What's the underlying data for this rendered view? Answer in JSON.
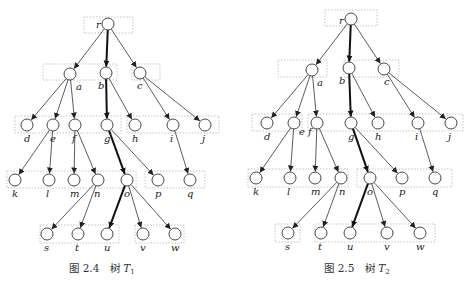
{
  "trees": [
    {
      "id": "T1",
      "caption": {
        "fig": "图 2.4",
        "word": "树",
        "symbol": "T",
        "sub": "1",
        "x": 102,
        "y": 272
      },
      "nodes": {
        "r": [
          108,
          24
        ],
        "a": [
          70,
          74
        ],
        "b": [
          106,
          73
        ],
        "c": [
          140,
          73
        ],
        "d": [
          27,
          125
        ],
        "e": [
          53,
          125
        ],
        "f": [
          75,
          125
        ],
        "g": [
          107,
          125
        ],
        "h": [
          135,
          125
        ],
        "i": [
          173,
          125
        ],
        "j": [
          205,
          125
        ],
        "k": [
          15,
          180
        ],
        "l": [
          49,
          180
        ],
        "m": [
          74,
          180
        ],
        "n": [
          98,
          180
        ],
        "o": [
          127,
          180
        ],
        "p": [
          158,
          180
        ],
        "q": [
          190,
          180
        ],
        "s": [
          47,
          234
        ],
        "t": [
          78,
          234
        ],
        "u": [
          107,
          234
        ],
        "v": [
          143,
          234
        ],
        "w": [
          175,
          234
        ]
      },
      "label_pos": {
        "r": [
          -12,
          4
        ],
        "a": [
          6,
          16
        ],
        "b": [
          -8,
          16
        ],
        "c": [
          -3,
          16
        ],
        "d": [
          -3,
          17
        ],
        "e": [
          -3,
          17
        ],
        "f": [
          -3,
          17
        ],
        "g": [
          -3,
          17
        ],
        "h": [
          -3,
          17
        ],
        "i": [
          -3,
          17
        ],
        "j": [
          -3,
          17
        ],
        "k": [
          -3,
          17
        ],
        "l": [
          -3,
          17
        ],
        "m": [
          -4,
          17
        ],
        "n": [
          -4,
          17
        ],
        "o": [
          -3,
          17
        ],
        "p": [
          -3,
          17
        ],
        "q": [
          -3,
          17
        ],
        "s": [
          -3,
          17
        ],
        "t": [
          -3,
          17
        ],
        "u": [
          -3,
          17
        ],
        "v": [
          -3,
          17
        ],
        "w": [
          -4,
          17
        ]
      },
      "edges": [
        [
          "r",
          "a",
          0
        ],
        [
          "r",
          "b",
          1
        ],
        [
          "r",
          "c",
          0
        ],
        [
          "a",
          "d",
          0
        ],
        [
          "a",
          "e",
          0
        ],
        [
          "a",
          "f",
          0
        ],
        [
          "b",
          "g",
          1
        ],
        [
          "b",
          "h",
          0
        ],
        [
          "c",
          "i",
          0
        ],
        [
          "c",
          "j",
          0
        ],
        [
          "e",
          "k",
          0
        ],
        [
          "e",
          "l",
          0
        ],
        [
          "f",
          "m",
          0
        ],
        [
          "f",
          "n",
          0
        ],
        [
          "g",
          "o",
          1
        ],
        [
          "g",
          "p",
          0
        ],
        [
          "i",
          "q",
          0
        ],
        [
          "n",
          "s",
          0
        ],
        [
          "n",
          "t",
          0
        ],
        [
          "o",
          "u",
          1
        ],
        [
          "o",
          "v",
          0
        ],
        [
          "o",
          "w",
          0
        ]
      ],
      "boxes": [
        [
          84,
          17,
          49,
          16
        ],
        [
          43,
          64,
          74,
          16
        ],
        [
          132,
          64,
          28,
          16
        ],
        [
          15,
          116,
          106,
          17
        ],
        [
          127,
          116,
          92,
          17
        ],
        [
          7,
          171,
          129,
          17
        ],
        [
          145,
          171,
          60,
          17
        ],
        [
          40,
          225,
          79,
          18
        ],
        [
          135,
          225,
          49,
          18
        ]
      ]
    },
    {
      "id": "T2",
      "caption": {
        "fig": "图 2.5",
        "word": "树",
        "symbol": "T",
        "sub": "2",
        "x": 357,
        "y": 272
      },
      "nodes": {
        "r": [
          351,
          19
        ],
        "a": [
          312,
          70
        ],
        "b": [
          349,
          68
        ],
        "c": [
          384,
          69
        ],
        "d": [
          267,
          123
        ],
        "e": [
          294,
          123
        ],
        "f": [
          317,
          123
        ],
        "g": [
          351,
          123
        ],
        "h": [
          378,
          123
        ],
        "i": [
          418,
          123
        ],
        "j": [
          451,
          123
        ],
        "k": [
          256,
          178
        ],
        "l": [
          290,
          178
        ],
        "m": [
          315,
          178
        ],
        "n": [
          341,
          178
        ],
        "o": [
          370,
          178
        ],
        "p": [
          402,
          178
        ],
        "q": [
          435,
          178
        ],
        "s": [
          288,
          233
        ],
        "t": [
          321,
          233
        ],
        "u": [
          350,
          233
        ],
        "v": [
          387,
          233
        ],
        "w": [
          420,
          233
        ]
      },
      "label_pos": {
        "r": [
          -12,
          5
        ],
        "a": [
          5,
          16
        ],
        "b": [
          -10,
          16
        ],
        "c": [
          0,
          16
        ],
        "d": [
          -3,
          17
        ],
        "e": [
          5,
          12
        ],
        "f": [
          -9,
          12
        ],
        "g": [
          -3,
          17
        ],
        "h": [
          -3,
          17
        ],
        "i": [
          -3,
          17
        ],
        "j": [
          -3,
          17
        ],
        "k": [
          -3,
          17
        ],
        "l": [
          -3,
          17
        ],
        "m": [
          -4,
          17
        ],
        "n": [
          -2,
          17
        ],
        "o": [
          -3,
          17
        ],
        "p": [
          -3,
          17
        ],
        "q": [
          -3,
          17
        ],
        "s": [
          -3,
          17
        ],
        "t": [
          -3,
          17
        ],
        "u": [
          -3,
          17
        ],
        "v": [
          -3,
          17
        ],
        "w": [
          -4,
          17
        ]
      },
      "edges": [
        [
          "r",
          "a",
          0
        ],
        [
          "r",
          "b",
          1
        ],
        [
          "r",
          "c",
          0
        ],
        [
          "a",
          "d",
          0
        ],
        [
          "a",
          "e",
          0
        ],
        [
          "a",
          "f",
          0
        ],
        [
          "b",
          "g",
          1
        ],
        [
          "b",
          "h",
          0
        ],
        [
          "c",
          "i",
          0
        ],
        [
          "c",
          "j",
          0
        ],
        [
          "e",
          "k",
          0
        ],
        [
          "e",
          "l",
          0
        ],
        [
          "f",
          "m",
          0
        ],
        [
          "f",
          "n",
          0
        ],
        [
          "g",
          "o",
          1
        ],
        [
          "g",
          "p",
          0
        ],
        [
          "i",
          "q",
          0
        ],
        [
          "n",
          "s",
          0
        ],
        [
          "n",
          "t",
          0
        ],
        [
          "o",
          "u",
          1
        ],
        [
          "o",
          "v",
          0
        ],
        [
          "o",
          "w",
          0
        ]
      ],
      "boxes": [
        [
          325,
          10,
          52,
          16
        ],
        [
          278,
          60,
          49,
          17
        ],
        [
          344,
          60,
          55,
          17
        ],
        [
          252,
          114,
          50,
          17
        ],
        [
          308,
          114,
          155,
          17
        ],
        [
          248,
          169,
          100,
          18
        ],
        [
          357,
          169,
          95,
          18
        ],
        [
          275,
          224,
          25,
          18
        ],
        [
          315,
          224,
          120,
          18
        ]
      ]
    }
  ],
  "style": {
    "node_radius": 6,
    "edge_color": "#333333",
    "box_color": "#b8b8b8"
  }
}
